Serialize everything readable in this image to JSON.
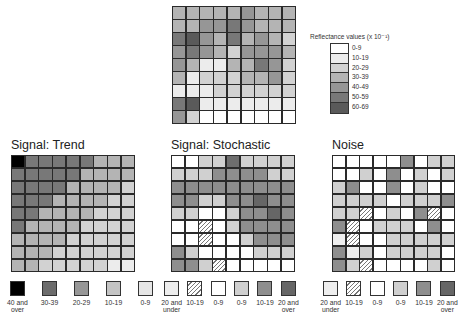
{
  "shades": [
    "#ffffff",
    "#ececec",
    "#d2d2d2",
    "#b4b4b4",
    "#969696",
    "#787878",
    "#5a5a5a",
    "#000000"
  ],
  "top_grid": {
    "rows": [
      [
        3,
        3,
        3,
        3,
        3,
        4,
        3,
        3,
        3
      ],
      [
        3,
        3,
        4,
        4,
        5,
        4,
        3,
        3,
        3
      ],
      [
        5,
        6,
        4,
        3,
        5,
        3,
        4,
        3,
        2
      ],
      [
        4,
        5,
        4,
        3,
        2,
        4,
        4,
        4,
        3
      ],
      [
        4,
        3,
        1,
        1,
        3,
        3,
        5,
        4,
        2
      ],
      [
        3,
        1,
        2,
        2,
        2,
        3,
        3,
        4,
        2
      ],
      [
        1,
        1,
        1,
        2,
        2,
        2,
        2,
        2,
        2
      ],
      [
        5,
        6,
        1,
        1,
        1,
        1,
        1,
        1,
        1
      ],
      [
        4,
        2,
        0,
        0,
        0,
        0,
        0,
        0,
        0
      ]
    ]
  },
  "top_legend": {
    "title": "Reflectance values (x 10⁻¹)",
    "items": [
      {
        "label": "0-9",
        "shade": 0
      },
      {
        "label": "10-19",
        "shade": 1
      },
      {
        "label": "20-29",
        "shade": 2
      },
      {
        "label": "30-39",
        "shade": 3
      },
      {
        "label": "40-49",
        "shade": 4
      },
      {
        "label": "50-59",
        "shade": 5
      },
      {
        "label": "60-69",
        "shade": 6
      }
    ]
  },
  "panels": [
    {
      "title": "Signal: Trend",
      "rows": [
        [
          7,
          5,
          5,
          5,
          5,
          5,
          3,
          3,
          3
        ],
        [
          5,
          5,
          5,
          5,
          5,
          3,
          3,
          3,
          3
        ],
        [
          5,
          5,
          5,
          5,
          3,
          3,
          3,
          3,
          2
        ],
        [
          5,
          5,
          5,
          3,
          3,
          3,
          3,
          2,
          2
        ],
        [
          5,
          5,
          3,
          3,
          3,
          3,
          2,
          2,
          2
        ],
        [
          5,
          3,
          3,
          3,
          3,
          2,
          2,
          2,
          2
        ],
        [
          3,
          3,
          3,
          3,
          2,
          2,
          2,
          2,
          2
        ],
        [
          3,
          3,
          3,
          2,
          2,
          2,
          2,
          2,
          2
        ],
        [
          3,
          3,
          2,
          2,
          2,
          2,
          2,
          1,
          1
        ]
      ],
      "legend": [
        {
          "label": "40 and over",
          "style": "s7"
        },
        {
          "label": "30-39",
          "style": "s5"
        },
        {
          "label": "20-29",
          "style": "s4"
        },
        {
          "label": "10-19",
          "style": "s2"
        },
        {
          "label": "0-9",
          "style": "s1"
        }
      ]
    },
    {
      "title": "Signal: Stochastic",
      "rows": [
        [
          "w",
          "w",
          "l",
          "l",
          "d",
          "l",
          "l",
          "l",
          "l"
        ],
        [
          "l",
          "l",
          "l",
          "m",
          "m",
          "m",
          "m",
          "l",
          "l"
        ],
        [
          "m",
          "m",
          "m",
          "m",
          "m",
          "m",
          "m",
          "m",
          "m"
        ],
        [
          "m",
          "m",
          "l",
          "l",
          "m",
          "m",
          "D",
          "m",
          "m"
        ],
        [
          "l",
          "l",
          "w",
          "w",
          "l",
          "m",
          "m",
          "D",
          "m"
        ],
        [
          "w",
          "w",
          "h",
          "w",
          "l",
          "m",
          "m",
          "m",
          "m"
        ],
        [
          "w",
          "w",
          "h",
          "w",
          "w",
          "l",
          "m",
          "m",
          "m"
        ],
        [
          "m",
          "l",
          "w",
          "w",
          "w",
          "w",
          "l",
          "l",
          "l"
        ],
        [
          "m",
          "m",
          "l",
          "h",
          "w",
          "w",
          "w",
          "w",
          "w"
        ]
      ],
      "legend": [
        {
          "label": "20 and under",
          "style": "dots"
        },
        {
          "label": "10-19",
          "style": "hatch"
        },
        {
          "label": "0-9",
          "style": "w"
        },
        {
          "label": "0-9",
          "style": "l"
        },
        {
          "label": "10-19",
          "style": "m"
        },
        {
          "label": "20 and over",
          "style": "D"
        }
      ]
    },
    {
      "title": "Noise",
      "rows": [
        [
          "w",
          "w",
          "w",
          "w",
          "w",
          "m",
          "w",
          "l",
          "l"
        ],
        [
          "w",
          "w",
          "l",
          "w",
          "m",
          "w",
          "l",
          "w",
          "l"
        ],
        [
          "l",
          "m",
          "w",
          "w",
          "m",
          "w",
          "l",
          "w",
          "w"
        ],
        [
          "l",
          "l",
          "l",
          "l",
          "w",
          "l",
          "l",
          "l",
          "m"
        ],
        [
          "l",
          "l",
          "h",
          "w",
          "l",
          "w",
          "m",
          "h",
          "w"
        ],
        [
          "m",
          "h",
          "w",
          "l",
          "l",
          "l",
          "w",
          "m",
          "w"
        ],
        [
          "dt",
          "h",
          "w",
          "w",
          "l",
          "l",
          "l",
          "l",
          "l"
        ],
        [
          "m",
          "dt",
          "l",
          "w",
          "l",
          "l",
          "l",
          "l",
          "w"
        ],
        [
          "m",
          "l",
          "h",
          "w",
          "w",
          "w",
          "w",
          "l",
          "w"
        ]
      ],
      "legend": [
        {
          "label": "20 and under",
          "style": "dots"
        },
        {
          "label": "10-19",
          "style": "hatch"
        },
        {
          "label": "0-9",
          "style": "w"
        },
        {
          "label": "0-9",
          "style": "l"
        },
        {
          "label": "10-19",
          "style": "m"
        },
        {
          "label": "20 and over",
          "style": "D"
        }
      ]
    }
  ]
}
